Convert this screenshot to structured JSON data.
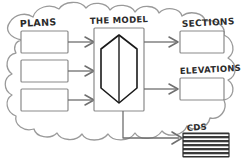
{
  "diagram": {
    "type": "hand-drawn-workflow",
    "title_visible": false,
    "container": {
      "shape": "cloud",
      "stroke_color": "#8d8d8d",
      "fill_color": "#ffffff"
    },
    "labels": {
      "plans": "PLANS",
      "the_model": "THE MODEL",
      "sections": "SECTIONS",
      "elevations": "ELEVATIONS",
      "cds": "CDS"
    },
    "inputs": {
      "group_label": "PLANS",
      "boxes": [
        {
          "id": "plan-box-1",
          "text": ""
        },
        {
          "id": "plan-box-2",
          "text": ""
        },
        {
          "id": "plan-box-3",
          "text": ""
        }
      ]
    },
    "center": {
      "label": "THE MODEL",
      "glyph": "hexagonal-prism",
      "stroke_color": "#1a1a1a"
    },
    "outputs": [
      {
        "id": "sections",
        "label": "SECTIONS",
        "fill": "none"
      },
      {
        "id": "elevations",
        "label": "ELEVATIONS",
        "fill": "none"
      },
      {
        "id": "cds",
        "label": "CDS",
        "fill": "hatched"
      }
    ],
    "connectors": {
      "count": 6,
      "style": "arrow",
      "color": "#6f6f6f"
    }
  }
}
